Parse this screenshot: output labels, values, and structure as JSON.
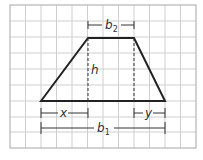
{
  "diagram": {
    "type": "trapezoid-area-decomposition",
    "grid": {
      "columns": 12,
      "rows": 9,
      "line_color": "#c8c8c8",
      "border_color": "#b0b0b0"
    },
    "shape": {
      "name": "trapezoid",
      "stroke_color": "#222222"
    },
    "labels": {
      "top_base": "b",
      "top_base_sub": "2",
      "bottom_base": "b",
      "bottom_base_sub": "1",
      "height": "h",
      "left_offset": "x",
      "right_offset": "y"
    }
  }
}
